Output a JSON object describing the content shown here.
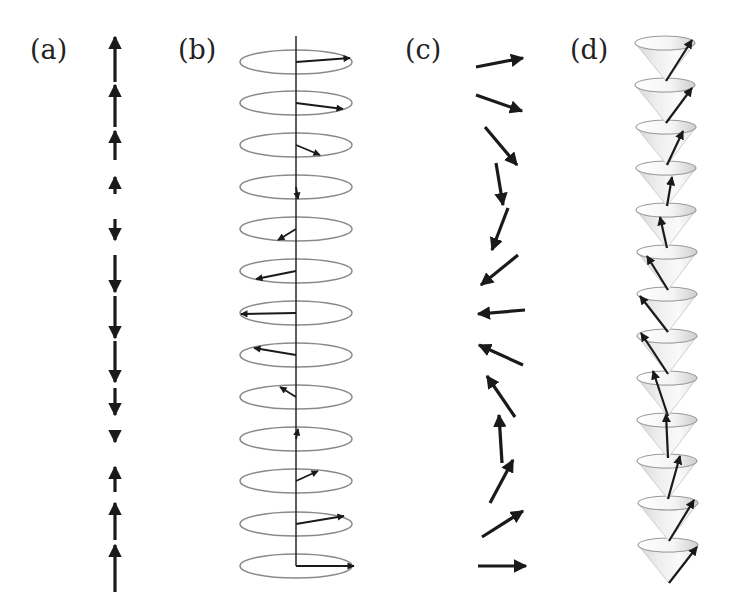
{
  "figure": {
    "panels": [
      {
        "id": "a",
        "label": "(a)",
        "description": "Longitudinal spin density wave: collinear arrows along a vertical axis, lengths modulated",
        "label_pos": [
          30,
          36
        ]
      },
      {
        "id": "b",
        "label": "(b)",
        "description": "Spiral/helix: arrows rotating in horizontal planes drawn as ellipses",
        "label_pos": [
          178,
          36
        ]
      },
      {
        "id": "c",
        "label": "(c)",
        "description": "Cycloidal spiral: arrows rotating in the plane of the page",
        "label_pos": [
          405,
          36
        ]
      },
      {
        "id": "d",
        "label": "(d)",
        "description": "Conical spiral: arrows precessing on stacked cones",
        "label_pos": [
          570,
          36
        ]
      }
    ]
  },
  "panel_a": {
    "x": 115,
    "arrows": [
      {
        "y1": 82,
        "y2": 37,
        "dir": "up"
      },
      {
        "y1": 127,
        "y2": 85,
        "dir": "up"
      },
      {
        "y1": 160,
        "y2": 131,
        "dir": "up"
      },
      {
        "y1": 194,
        "y2": 177,
        "dir": "up"
      },
      {
        "y1": 219,
        "y2": 240,
        "dir": "down"
      },
      {
        "y1": 255,
        "y2": 292,
        "dir": "down"
      },
      {
        "y1": 296,
        "y2": 338,
        "dir": "down"
      },
      {
        "y1": 341,
        "y2": 382,
        "dir": "down"
      },
      {
        "y1": 388,
        "y2": 415,
        "dir": "down"
      },
      {
        "y1": 435,
        "y2": 442,
        "dir": "down"
      },
      {
        "y1": 492,
        "y2": 467,
        "dir": "up"
      },
      {
        "y1": 540,
        "y2": 503,
        "dir": "up"
      },
      {
        "y1": 592,
        "y2": 545,
        "dir": "up"
      }
    ]
  },
  "panel_b": {
    "axis_x": 296,
    "axis_top": 36,
    "ellipse_rx": 56,
    "ellipse_ry": 12,
    "ellipses": [
      {
        "cy": 62,
        "tip": [
          350,
          58
        ]
      },
      {
        "cy": 103,
        "tip": [
          343,
          109
        ]
      },
      {
        "cy": 145,
        "tip": [
          320,
          155
        ]
      },
      {
        "cy": 187,
        "tip": [
          298,
          199
        ]
      },
      {
        "cy": 229,
        "tip": [
          278,
          240
        ]
      },
      {
        "cy": 271,
        "tip": [
          256,
          279
        ]
      },
      {
        "cy": 313,
        "tip": [
          241,
          314
        ]
      },
      {
        "cy": 355,
        "tip": [
          254,
          348
        ]
      },
      {
        "cy": 397,
        "tip": [
          280,
          387
        ]
      },
      {
        "cy": 439,
        "tip": [
          298,
          429
        ]
      },
      {
        "cy": 481,
        "tip": [
          318,
          471
        ]
      },
      {
        "cy": 524,
        "tip": [
          344,
          516
        ]
      },
      {
        "cy": 566,
        "tip": [
          354,
          566
        ]
      }
    ]
  },
  "panel_c": {
    "arrows": [
      {
        "from": [
          476,
          67
        ],
        "to": [
          523,
          58
        ]
      },
      {
        "from": [
          476,
          95
        ],
        "to": [
          522,
          111
        ]
      },
      {
        "from": [
          485,
          127
        ],
        "to": [
          517,
          165
        ]
      },
      {
        "from": [
          496,
          163
        ],
        "to": [
          503,
          205
        ]
      },
      {
        "from": [
          508,
          208
        ],
        "to": [
          492,
          250
        ]
      },
      {
        "from": [
          518,
          255
        ],
        "to": [
          481,
          285
        ]
      },
      {
        "from": [
          525,
          310
        ],
        "to": [
          478,
          314
        ]
      },
      {
        "from": [
          523,
          365
        ],
        "to": [
          479,
          345
        ]
      },
      {
        "from": [
          515,
          417
        ],
        "to": [
          487,
          376
        ]
      },
      {
        "from": [
          502,
          463
        ],
        "to": [
          499,
          415
        ]
      },
      {
        "from": [
          490,
          503
        ],
        "to": [
          513,
          460
        ]
      },
      {
        "from": [
          482,
          537
        ],
        "to": [
          523,
          511
        ]
      },
      {
        "from": [
          478,
          566
        ],
        "to": [
          526,
          566
        ]
      }
    ]
  },
  "panel_d": {
    "cone_rx": 30,
    "cone_ry": 7,
    "cone_height": 38,
    "cones": [
      {
        "cx": 665,
        "cy": 43,
        "tip": [
          692,
          40
        ]
      },
      {
        "cx": 665,
        "cy": 85,
        "tip": [
          692,
          88
        ]
      },
      {
        "cx": 666,
        "cy": 127,
        "tip": [
          683,
          131
        ]
      },
      {
        "cx": 666,
        "cy": 168,
        "tip": [
          672,
          177
        ]
      },
      {
        "cx": 666,
        "cy": 210,
        "tip": [
          660,
          217
        ]
      },
      {
        "cx": 667,
        "cy": 252,
        "tip": [
          647,
          256
        ]
      },
      {
        "cx": 667,
        "cy": 294,
        "tip": [
          640,
          296
        ]
      },
      {
        "cx": 667,
        "cy": 336,
        "tip": [
          641,
          333
        ]
      },
      {
        "cx": 667,
        "cy": 378,
        "tip": [
          653,
          371
        ]
      },
      {
        "cx": 667,
        "cy": 420,
        "tip": [
          666,
          414
        ]
      },
      {
        "cx": 667,
        "cy": 461,
        "tip": [
          680,
          456
        ]
      },
      {
        "cx": 668,
        "cy": 503,
        "tip": [
          694,
          500
        ]
      },
      {
        "cx": 668,
        "cy": 545,
        "tip": [
          697,
          547
        ]
      }
    ]
  }
}
